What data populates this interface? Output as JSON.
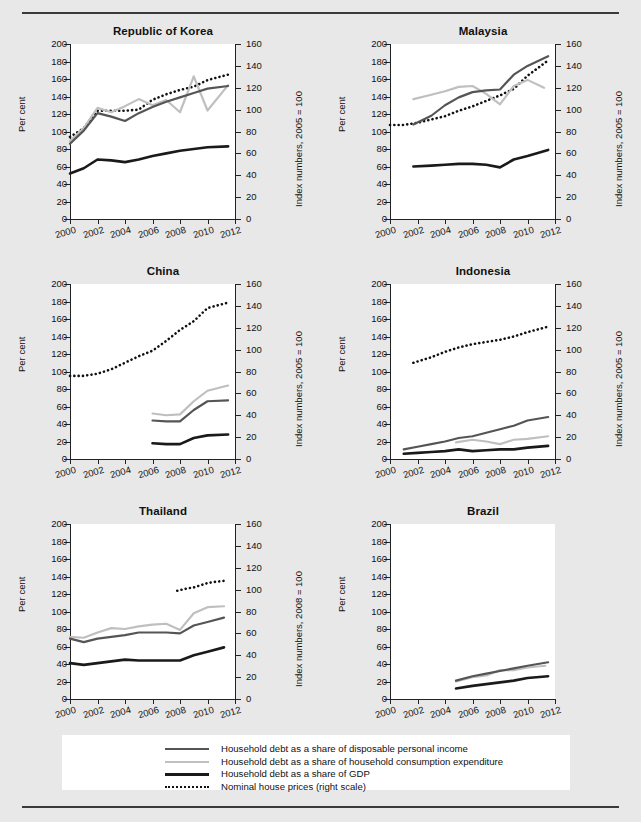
{
  "legend": {
    "items": [
      {
        "label": "Household debt as a share of disposable personal income",
        "key": "dpi",
        "color": "#555555",
        "style": "solid",
        "width": 2.2
      },
      {
        "label": "Household debt as a share of household consumption expenditure",
        "key": "hce",
        "color": "#bfbfbf",
        "style": "solid",
        "width": 2.2
      },
      {
        "label": "Household debt as a share of GDP",
        "key": "gdp",
        "color": "#1a1a1a",
        "style": "solid",
        "width": 2.6
      },
      {
        "label": "Nominal house prices (right scale)",
        "key": "hp",
        "color": "#111111",
        "style": "dotted",
        "width": 2.6
      }
    ]
  },
  "axes": {
    "x_ticks": [
      2000,
      2002,
      2004,
      2006,
      2008,
      2010,
      2012
    ],
    "x_min": 2000,
    "x_max": 2012,
    "left_ticks": [
      0,
      20,
      40,
      60,
      80,
      100,
      120,
      140,
      160,
      180,
      200
    ],
    "right_ticks": [
      0,
      20,
      40,
      60,
      80,
      100,
      120,
      140,
      160
    ],
    "left_min": 0,
    "left_max": 200,
    "right_min": 0,
    "right_max": 160,
    "ylabel_left": "Per cent"
  },
  "chart_data": [
    {
      "type": "line",
      "title": "Republic of Korea",
      "xlabel": "",
      "ylabel": "Per cent",
      "ylabel_right": "Index numbers, 2005 = 100",
      "xlim": [
        2000,
        2012
      ],
      "ylim": [
        0,
        200
      ],
      "ylim_right": [
        0,
        160
      ],
      "grid": false,
      "legend_position": "below-figure",
      "series": [
        {
          "name": "Household debt as a share of disposable personal income",
          "key": "dpi",
          "axis": "left",
          "x": [
            2000,
            2001,
            2002,
            2003,
            2004,
            2005,
            2006,
            2007,
            2008,
            2009,
            2010,
            2011.5
          ],
          "y": [
            86,
            101,
            121,
            117,
            112,
            121,
            128,
            134,
            139,
            144,
            149,
            152
          ]
        },
        {
          "name": "Household debt as a share of household consumption expenditure",
          "key": "hce",
          "axis": "left",
          "x": [
            2000,
            2001,
            2002,
            2003,
            2004,
            2005,
            2006,
            2007,
            2008,
            2009,
            2010,
            2011.5
          ],
          "y": [
            89,
            104,
            127,
            122,
            129,
            137,
            130,
            136,
            122,
            163,
            124,
            153
          ]
        },
        {
          "name": "Household debt as a share of GDP",
          "key": "gdp",
          "axis": "left",
          "x": [
            2000,
            2001,
            2002,
            2003,
            2004,
            2005,
            2006,
            2007,
            2008,
            2009,
            2010,
            2011.5
          ],
          "y": [
            52,
            58,
            68,
            67,
            65,
            68,
            72,
            75,
            78,
            80,
            82,
            83
          ]
        },
        {
          "name": "Nominal house prices (right scale)",
          "key": "hp",
          "axis": "right",
          "x": [
            2000,
            2001,
            2002,
            2003,
            2004,
            2005,
            2006,
            2007,
            2008,
            2009,
            2010,
            2011.5
          ],
          "y": [
            75,
            83,
            99,
            99,
            99,
            100,
            109,
            114,
            118,
            121,
            127,
            132
          ]
        }
      ]
    },
    {
      "type": "line",
      "title": "Malaysia",
      "xlabel": "",
      "ylabel": "Per cent",
      "ylabel_right": "Index numbers, 2005 = 100",
      "xlim": [
        2000,
        2012
      ],
      "ylim": [
        0,
        200
      ],
      "ylim_right": [
        0,
        160
      ],
      "grid": false,
      "legend_position": "below-figure",
      "series": [
        {
          "name": "Household debt as a share of disposable personal income",
          "key": "dpi",
          "axis": "left",
          "x": [
            2001.7,
            2003,
            2004,
            2005,
            2006,
            2007,
            2008,
            2009,
            2010,
            2011.5
          ],
          "y": [
            108,
            118,
            130,
            139,
            145,
            147,
            148,
            165,
            175,
            186
          ]
        },
        {
          "name": "Household debt as a share of household consumption expenditure",
          "key": "hce",
          "axis": "left",
          "x": [
            2001.7,
            2003,
            2004,
            2005,
            2006,
            2007,
            2008,
            2009,
            2010,
            2011.2
          ],
          "y": [
            137,
            142,
            146,
            151,
            152,
            143,
            131,
            152,
            159,
            150
          ]
        },
        {
          "name": "Household debt as a share of GDP",
          "key": "gdp",
          "axis": "left",
          "x": [
            2001.7,
            2003,
            2004,
            2005,
            2006,
            2007,
            2008,
            2009,
            2010,
            2011.5
          ],
          "y": [
            60,
            61,
            62,
            63,
            63,
            62,
            59,
            68,
            72,
            79
          ]
        },
        {
          "name": "Nominal house prices (right scale)",
          "key": "hp",
          "axis": "right",
          "x": [
            2000,
            2001,
            2002,
            2003,
            2004,
            2005,
            2006,
            2007,
            2008,
            2009,
            2010,
            2011.5
          ],
          "y": [
            86,
            86,
            88,
            91,
            94,
            99,
            103,
            108,
            113,
            119,
            131,
            145
          ]
        }
      ]
    },
    {
      "type": "line",
      "title": "China",
      "xlabel": "",
      "ylabel": "Per cent",
      "ylabel_right": "Index numbers, 2005 = 100",
      "xlim": [
        2000,
        2012
      ],
      "ylim": [
        0,
        200
      ],
      "ylim_right": [
        0,
        160
      ],
      "grid": false,
      "legend_position": "below-figure",
      "series": [
        {
          "name": "Household debt as a share of disposable personal income",
          "key": "dpi",
          "axis": "left",
          "x": [
            2006,
            2007,
            2008,
            2009,
            2010,
            2011.5
          ],
          "y": [
            44,
            43,
            43,
            56,
            66,
            67
          ]
        },
        {
          "name": "Household debt as a share of household consumption expenditure",
          "key": "hce",
          "axis": "left",
          "x": [
            2006,
            2007,
            2008,
            2009,
            2010,
            2011.5
          ],
          "y": [
            52,
            50,
            51,
            66,
            78,
            84
          ]
        },
        {
          "name": "Household debt as a share of GDP",
          "key": "gdp",
          "axis": "left",
          "x": [
            2006,
            2007,
            2008,
            2009,
            2010,
            2011.5
          ],
          "y": [
            18,
            17,
            17,
            24,
            27,
            28
          ]
        },
        {
          "name": "Nominal house prices (right scale)",
          "key": "hp",
          "axis": "right",
          "x": [
            2000,
            2001,
            2002,
            2003,
            2004,
            2005,
            2006,
            2007,
            2008,
            2009,
            2010,
            2011.5
          ],
          "y": [
            76,
            76,
            78,
            82,
            88,
            94,
            99,
            108,
            118,
            126,
            138,
            143
          ]
        }
      ]
    },
    {
      "type": "line",
      "title": "Indonesia",
      "xlabel": "",
      "ylabel": "Per cent",
      "ylabel_right": "Index numbers, 2005 = 100",
      "xlim": [
        2000,
        2012
      ],
      "ylim": [
        0,
        200
      ],
      "ylim_right": [
        0,
        160
      ],
      "grid": false,
      "legend_position": "below-figure",
      "series": [
        {
          "name": "Household debt as a share of disposable personal income",
          "key": "dpi",
          "axis": "left",
          "x": [
            2001,
            2002,
            2003,
            2004,
            2005,
            2006,
            2007,
            2008,
            2009,
            2010,
            2011.5
          ],
          "y": [
            11,
            14,
            17,
            20,
            24,
            26,
            30,
            34,
            38,
            44,
            48
          ]
        },
        {
          "name": "Household debt as a share of household consumption expenditure",
          "key": "hce",
          "axis": "left",
          "x": [
            2004.8,
            2006,
            2007,
            2008,
            2009,
            2010,
            2011.5
          ],
          "y": [
            19,
            22,
            20,
            17,
            22,
            23,
            26
          ]
        },
        {
          "name": "Household debt as a share of GDP",
          "key": "gdp",
          "axis": "left",
          "x": [
            2001,
            2002,
            2003,
            2004,
            2005,
            2006,
            2007,
            2008,
            2009,
            2010,
            2011.5
          ],
          "y": [
            6,
            7,
            8,
            9,
            11,
            9,
            10,
            11,
            11,
            13,
            15
          ]
        },
        {
          "name": "Nominal house prices (right scale)",
          "key": "hp",
          "axis": "right",
          "x": [
            2001.7,
            2003,
            2004,
            2005,
            2006,
            2007,
            2008,
            2009,
            2010,
            2011.5
          ],
          "y": [
            88,
            93,
            98,
            102,
            105,
            107,
            109,
            112,
            116,
            121
          ]
        }
      ]
    },
    {
      "type": "line",
      "title": "Thailand",
      "xlabel": "",
      "ylabel": "Per cent",
      "ylabel_right": "Index numbers, 2008 = 100",
      "xlim": [
        2000,
        2012
      ],
      "ylim": [
        0,
        200
      ],
      "ylim_right": [
        0,
        160
      ],
      "grid": false,
      "legend_position": "below-figure",
      "series": [
        {
          "name": "Household debt as a share of disposable personal income",
          "key": "dpi",
          "axis": "left",
          "x": [
            2000,
            2001,
            2002,
            2003,
            2004,
            2005,
            2006,
            2007,
            2008,
            2009,
            2010,
            2011.2
          ],
          "y": [
            69,
            65,
            69,
            71,
            73,
            76,
            76,
            76,
            75,
            84,
            88,
            93
          ]
        },
        {
          "name": "Household debt as a share of household consumption expenditure",
          "key": "hce",
          "axis": "left",
          "x": [
            2000,
            2001,
            2002,
            2003,
            2004,
            2005,
            2006,
            2007,
            2008,
            2009,
            2010,
            2011.2
          ],
          "y": [
            71,
            70,
            76,
            81,
            80,
            83,
            85,
            86,
            79,
            98,
            105,
            106
          ]
        },
        {
          "name": "Household debt as a share of GDP",
          "key": "gdp",
          "axis": "left",
          "x": [
            2000,
            2001,
            2002,
            2003,
            2004,
            2005,
            2006,
            2007,
            2008,
            2009,
            2010,
            2011.2
          ],
          "y": [
            41,
            39,
            41,
            43,
            45,
            44,
            44,
            44,
            44,
            50,
            54,
            59
          ]
        },
        {
          "name": "Nominal house prices (right scale)",
          "key": "hp",
          "axis": "right",
          "x": [
            2007.8,
            2008.5,
            2009,
            2009.5,
            2010,
            2010.5,
            2011.2
          ],
          "y": [
            99,
            101,
            102,
            104,
            106,
            107,
            108
          ]
        }
      ]
    },
    {
      "type": "line",
      "title": "Brazil",
      "xlabel": "",
      "ylabel": "Per cent",
      "ylabel_right": "",
      "xlim": [
        2000,
        2012
      ],
      "ylim": [
        0,
        200
      ],
      "ylim_right": null,
      "grid": false,
      "legend_position": "below-figure",
      "series": [
        {
          "name": "Household debt as a share of disposable personal income",
          "key": "dpi",
          "axis": "left",
          "x": [
            2004.8,
            2006,
            2007,
            2008,
            2009,
            2010,
            2011.5
          ],
          "y": [
            21,
            26,
            29,
            32,
            35,
            38,
            42
          ]
        },
        {
          "name": "Household debt as a share of household consumption expenditure",
          "key": "hce",
          "axis": "left",
          "x": [
            2004.8,
            2006,
            2007,
            2008,
            2009,
            2010,
            2011.3
          ],
          "y": [
            20,
            25,
            27,
            33,
            33,
            36,
            38
          ]
        },
        {
          "name": "Household debt as a share of GDP",
          "key": "gdp",
          "axis": "left",
          "x": [
            2004.8,
            2006,
            2007,
            2008,
            2009,
            2010,
            2011.5
          ],
          "y": [
            12,
            15,
            17,
            19,
            21,
            24,
            26
          ]
        }
      ]
    }
  ]
}
